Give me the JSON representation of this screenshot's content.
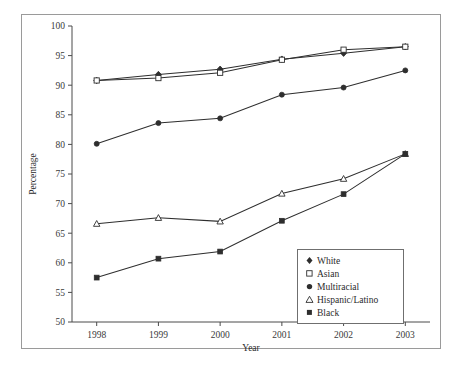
{
  "chart_data": {
    "type": "line",
    "title": "",
    "xlabel": "Year",
    "ylabel": "Percentage",
    "categories": [
      "1998",
      "1999",
      "2000",
      "2001",
      "2002",
      "2003"
    ],
    "x": [
      1998,
      1999,
      2000,
      2001,
      2002,
      2003
    ],
    "xlim": [
      1997.6,
      2003.4
    ],
    "ylim": [
      50,
      100
    ],
    "ytick_step": 5,
    "yticks": [
      50,
      55,
      60,
      65,
      70,
      75,
      80,
      85,
      90,
      95,
      100
    ],
    "grid": false,
    "legend_position": "inside-lower-right",
    "series": [
      {
        "name": "White",
        "marker": "filled-diamond",
        "values": [
          90.8,
          91.8,
          92.7,
          94.4,
          95.4,
          96.5
        ]
      },
      {
        "name": "Asian",
        "marker": "open-square",
        "values": [
          90.8,
          91.2,
          92.1,
          94.3,
          96.0,
          96.5
        ]
      },
      {
        "name": "Multiracial",
        "marker": "filled-circle",
        "values": [
          80.1,
          83.6,
          84.4,
          88.4,
          89.6,
          92.5
        ]
      },
      {
        "name": "Hispanic/Latino",
        "marker": "open-triangle",
        "values": [
          66.6,
          67.6,
          67.0,
          71.7,
          74.2,
          78.4
        ]
      },
      {
        "name": "Black",
        "marker": "filled-square",
        "values": [
          57.5,
          60.7,
          61.9,
          67.1,
          71.6,
          78.4
        ]
      }
    ]
  },
  "legend": {
    "items": [
      {
        "label": "White",
        "marker": "filled-diamond"
      },
      {
        "label": "Asian",
        "marker": "open-square"
      },
      {
        "label": "Multiracial",
        "marker": "filled-circle"
      },
      {
        "label": "Hispanic/Latino",
        "marker": "open-triangle"
      },
      {
        "label": "Black",
        "marker": "filled-square"
      }
    ]
  },
  "colors": {
    "ink": "#2e2e2e",
    "axis": "#4a4a4a",
    "frame": "#9a9a9a",
    "background": "#ffffff"
  }
}
